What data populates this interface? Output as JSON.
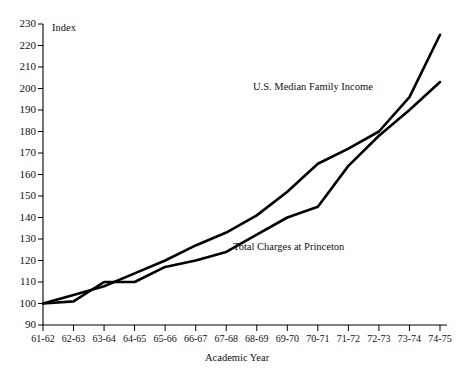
{
  "ghost_top_text": "",
  "chart_data": {
    "type": "line",
    "title": "",
    "xlabel": "Academic Year",
    "ylabel": "Index",
    "ylim": [
      90,
      230
    ],
    "ytick_step": 10,
    "yticks": [
      90,
      100,
      110,
      120,
      130,
      140,
      150,
      160,
      170,
      180,
      190,
      200,
      210,
      220,
      230
    ],
    "grid": false,
    "legend": "inline-annotations",
    "categories": [
      "61-62",
      "62-63",
      "63-64",
      "64-65",
      "65-66",
      "66-67",
      "67-68",
      "68-69",
      "69-70",
      "70-71",
      "71-72",
      "72-73",
      "73-74",
      "74-75"
    ],
    "series": [
      {
        "name": "U.S. Median Family Income",
        "color": "#000000",
        "values": [
          100,
          104,
          108,
          114,
          120,
          127,
          133,
          141,
          152,
          165,
          172,
          180,
          196,
          225
        ],
        "label_x_category": "68-69",
        "label_value": 196
      },
      {
        "name": "Total Charges at Princeton",
        "color": "#000000",
        "values": [
          100,
          101,
          110,
          110,
          117,
          120,
          124,
          132,
          140,
          145,
          164,
          178,
          190,
          203
        ],
        "label_x_category": "69-70",
        "label_value": 130
      }
    ],
    "annotations": [
      {
        "text": "U.S. Median Family Income",
        "x": 253,
        "y": 88
      },
      {
        "text": "Total Charges at Princeton",
        "x": 233,
        "y": 248
      }
    ]
  }
}
